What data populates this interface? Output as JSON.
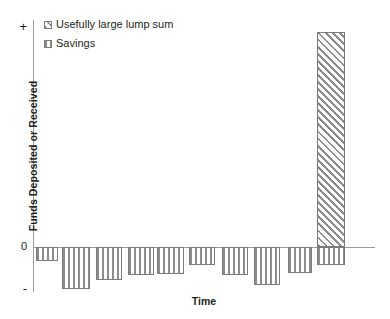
{
  "chart_data": {
    "type": "bar",
    "title": "",
    "xlabel": "Time",
    "ylabel": "Funds Deposited or Received",
    "x_tick_labels": [],
    "y_tick_labels": [
      "+",
      "0",
      "-"
    ],
    "grid": false,
    "legend_position": "top-left",
    "axis_note": "Unlabeled qualitative axes; y runs from negative (bottom) through 0 to positive (top)",
    "categories": [
      "1",
      "2",
      "3",
      "4",
      "5",
      "6",
      "7",
      "8",
      "9",
      "10"
    ],
    "series": [
      {
        "name": "Savings",
        "fill": "vertical-hatch",
        "values": [
          -0.33,
          -1.0,
          -0.79,
          -0.67,
          -0.64,
          -0.43,
          -0.67,
          -0.9,
          -0.62,
          -0.43
        ]
      },
      {
        "name": "Usefully large lump sum",
        "fill": "diagonal-hatch",
        "values": [
          0,
          0,
          0,
          0,
          0,
          0,
          0,
          0,
          0,
          5.0
        ]
      }
    ],
    "ylim": [
      -1.07,
      5.35
    ]
  },
  "axes": {
    "y_title": "Funds Deposited or Received",
    "x_title": "Time",
    "tick_plus": "+",
    "tick_zero": "0",
    "tick_minus": "-"
  },
  "legend": {
    "items": [
      {
        "label": "Usefully large lump sum",
        "pattern": "diagonal-hatch"
      },
      {
        "label": "Savings",
        "pattern": "vertical-hatch"
      }
    ]
  },
  "colors": {
    "hatch": "#8c8c8c",
    "bar_outline": "#7b7b7b",
    "axis": "#9a9a9a",
    "text": "#231f20",
    "background": "#ffffff"
  }
}
